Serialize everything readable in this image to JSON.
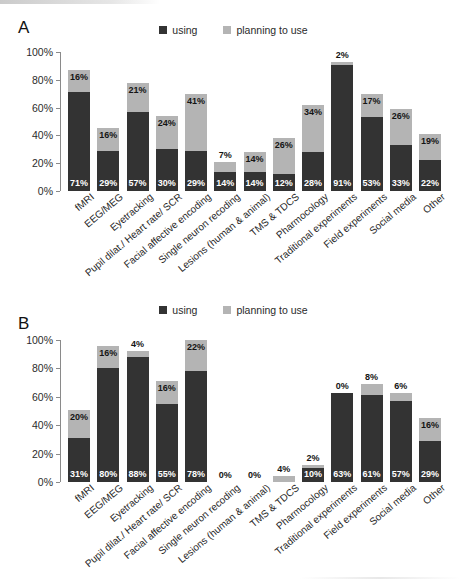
{
  "figure": {
    "panels": [
      {
        "letter": "A"
      },
      {
        "letter": "B"
      }
    ],
    "legend": {
      "using_label": "using",
      "planning_label": "planning to use",
      "using_color": "#333333",
      "planning_color": "#b4b4b4"
    },
    "yticks": [
      "100%",
      "80%",
      "60%",
      "40%",
      "20%",
      "0%"
    ]
  },
  "chart_data": [
    {
      "type": "bar",
      "panel": "A",
      "title": "",
      "xlabel": "",
      "ylabel": "",
      "ylim": [
        0,
        100
      ],
      "grid": false,
      "stacked": true,
      "legend_position": "top-center",
      "legend": [
        "using",
        "planning to use"
      ],
      "ytick_labels": [
        "0%",
        "20%",
        "40%",
        "60%",
        "80%",
        "100%"
      ],
      "categories": [
        "fMRI",
        "EEG/MEG",
        "Eyetracking",
        "Pupil dilat./ Heart rate/ SCR",
        "Facial affective encoding",
        "Single neuron recoding",
        "Lesions (human & animal)",
        "TMS & TDCS",
        "Pharmocology",
        "Traditional experiments",
        "Field experiments",
        "Social media",
        "Other"
      ],
      "series": [
        {
          "name": "using",
          "values": [
            71,
            29,
            57,
            30,
            29,
            14,
            14,
            12,
            28,
            91,
            53,
            33,
            22
          ]
        },
        {
          "name": "planning to use",
          "values": [
            16,
            16,
            21,
            24,
            41,
            7,
            14,
            26,
            34,
            2,
            17,
            26,
            19
          ]
        }
      ],
      "data_labels": {
        "using": [
          "71%",
          "29%",
          "57%",
          "30%",
          "29%",
          "14%",
          "14%",
          "12%",
          "28%",
          "91%",
          "53%",
          "33%",
          "22%"
        ],
        "planning": [
          "16%",
          "16%",
          "21%",
          "24%",
          "41%",
          "7%",
          "14%",
          "26%",
          "34%",
          "2%",
          "17%",
          "26%",
          "19%"
        ]
      }
    },
    {
      "type": "bar",
      "panel": "B",
      "title": "",
      "xlabel": "",
      "ylabel": "",
      "ylim": [
        0,
        100
      ],
      "grid": false,
      "stacked": true,
      "legend_position": "top-center",
      "legend": [
        "using",
        "planning to use"
      ],
      "ytick_labels": [
        "0%",
        "20%",
        "40%",
        "60%",
        "80%",
        "100%"
      ],
      "categories": [
        "fMRI",
        "EEG/MEG",
        "Eyetracking",
        "Pupil dilat./ Heart rate/ SCR",
        "Facial affective encoding",
        "Single neuron recoding",
        "Lesions (human & animal)",
        "TMS & TDCS",
        "Pharmocology",
        "Traditional experiments",
        "Field experiments",
        "Social media",
        "Other"
      ],
      "series": [
        {
          "name": "using",
          "values": [
            31,
            80,
            88,
            55,
            78,
            0,
            0,
            0,
            10,
            63,
            61,
            57,
            29
          ]
        },
        {
          "name": "planning to use",
          "values": [
            20,
            16,
            4,
            16,
            22,
            0,
            0,
            4,
            2,
            0,
            8,
            6,
            16
          ]
        }
      ],
      "data_labels": {
        "using": [
          "31%",
          "80%",
          "88%",
          "55%",
          "78%",
          "",
          "",
          "",
          "10%",
          "63%",
          "61%",
          "57%",
          "29%"
        ],
        "planning": [
          "20%",
          "16%",
          "4%",
          "16%",
          "22%",
          "0%",
          "0%",
          "4%",
          "2%",
          "0%",
          "8%",
          "6%",
          "16%"
        ]
      }
    }
  ]
}
